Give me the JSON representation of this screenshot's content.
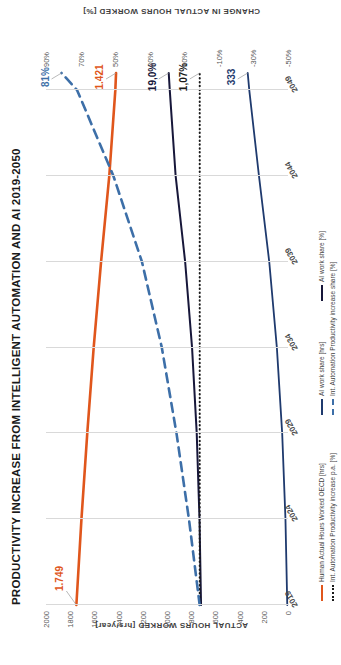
{
  "chart_data": {
    "type": "line",
    "title": "PRODUCTIVITY INCREASE  FROM INTELLIGENT AUTOMATION AND AI  2019-2050",
    "xlabel": "",
    "ylabel": "ACTUAL HOURS WORKED [hrs/year]",
    "y2label": "CHANGE IN ACTUAL HOURS WORKED [%]",
    "grid": true,
    "legend_position": "bottom",
    "x": [
      2019,
      2024,
      2029,
      2034,
      2039,
      2044,
      2049
    ],
    "xticklabels": [
      "2019",
      "2024",
      "2029",
      "2034",
      "2039",
      "2044",
      "2049"
    ],
    "xlim": [
      2019,
      2050
    ],
    "ylim": [
      0,
      2000
    ],
    "yticklabels": [
      "0",
      "200",
      "400",
      "600",
      "800",
      "1000",
      "1200",
      "1400",
      "1600",
      "1800",
      "2000"
    ],
    "yticks": [
      0,
      200,
      400,
      600,
      800,
      1000,
      1200,
      1400,
      1600,
      1800,
      2000
    ],
    "y2lim": [
      -50,
      90
    ],
    "y2ticklabels": [
      "-50%",
      "-30%",
      "-10%",
      "10%",
      "30%",
      "50%",
      "70%",
      "90%"
    ],
    "y2ticks": [
      -50,
      -30,
      -10,
      10,
      30,
      50,
      70,
      90
    ],
    "series": [
      {
        "name": "Human Actual Hours Worked OECD [hrs]",
        "axis": "left",
        "color": "#E0561C",
        "style": "solid",
        "width": 2.6,
        "x": [
          2019,
          2024,
          2029,
          2034,
          2039,
          2044,
          2049,
          2050
        ],
        "values": [
          1749,
          1707,
          1659,
          1606,
          1545,
          1477,
          1427,
          1421
        ],
        "start_label": "1.749",
        "end_label": "1.421"
      },
      {
        "name": "AI work share [hrs]",
        "axis": "left",
        "color": "#1F3A6E",
        "style": "solid",
        "width": 1.8,
        "x": [
          2019,
          2024,
          2029,
          2034,
          2039,
          2044,
          2049,
          2050
        ],
        "values": [
          6,
          21,
          48,
          92,
          155,
          240,
          320,
          333
        ],
        "end_label": "333"
      },
      {
        "name": "AI work share [%]",
        "axis": "right",
        "color": "#17173A",
        "style": "solid",
        "width": 2.0,
        "x": [
          2019,
          2024,
          2029,
          2034,
          2039,
          2044,
          2049,
          2050
        ],
        "values": [
          0.3,
          1.2,
          2.8,
          5.5,
          9.5,
          15.0,
          18.4,
          19.0
        ],
        "end_label": "19,0%"
      },
      {
        "name": "Int. Automation Productivity increase p.a. [%]",
        "axis": "right",
        "color": "#1a1a1a",
        "style": "dotted",
        "width": 2.0,
        "x": [
          2019,
          2024,
          2029,
          2034,
          2039,
          2044,
          2049,
          2050
        ],
        "values": [
          1.07,
          1.07,
          1.07,
          1.07,
          1.07,
          1.07,
          1.07,
          1.07
        ],
        "end_label": "1,07%"
      },
      {
        "name": "Int. Automation Productivity increase share [%]",
        "axis": "right",
        "color": "#3D6FA8",
        "style": "dashed",
        "width": 2.6,
        "x": [
          2019,
          2024,
          2029,
          2034,
          2039,
          2044,
          2049,
          2050
        ],
        "values": [
          1.1,
          7.3,
          14.5,
          23.0,
          34.5,
          51.0,
          72.0,
          81.0
        ],
        "end_label": "81%"
      }
    ],
    "annotations": [
      {
        "text": "1.749",
        "color": "#E0561C"
      },
      {
        "text": "1.421",
        "color": "#E0561C"
      },
      {
        "text": "19,0%",
        "color": "#17173A"
      },
      {
        "text": "1,07%",
        "color": "#1a1a1a"
      },
      {
        "text": "333",
        "color": "#1F3A6E"
      },
      {
        "text": "81%",
        "color": "#3D6FA8"
      }
    ]
  }
}
